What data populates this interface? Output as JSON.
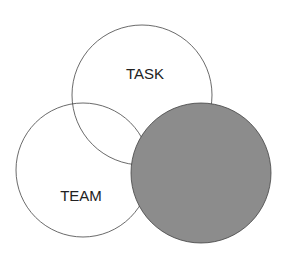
{
  "diagram": {
    "type": "venn",
    "circles": [
      {
        "id": "task",
        "label": "TASK",
        "cx": 142,
        "cy": 95,
        "r": 70,
        "fill": "#ffffff",
        "label_x": 145,
        "label_y": 79
      },
      {
        "id": "team",
        "label": "TEAM",
        "cx": 83,
        "cy": 170,
        "r": 67,
        "fill": "#ffffff",
        "label_x": 81,
        "label_y": 196
      },
      {
        "id": "individual",
        "label": "",
        "cx": 201,
        "cy": 173,
        "r": 70,
        "fill": "#8c8c8c"
      }
    ],
    "stroke": "#444444"
  }
}
